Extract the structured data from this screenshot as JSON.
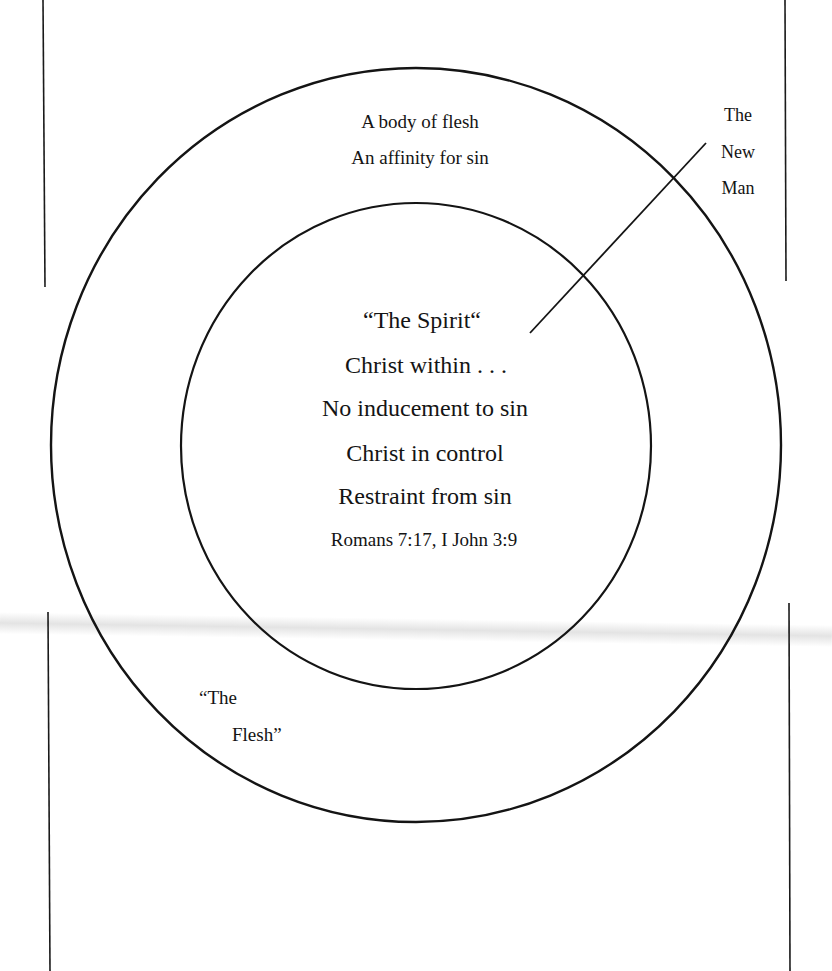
{
  "diagram": {
    "outer_circle": {
      "label": [
        "“The",
        "Flesh”"
      ],
      "description_lines": [
        "A body of flesh",
        "An affinity for sin"
      ]
    },
    "inner_circle": {
      "title": "“The Spirit“",
      "lines": [
        "Christ within . . .",
        "No inducement to sin",
        "Christ in control",
        "Restraint from sin"
      ],
      "reference": "Romans 7:17, I John 3:9"
    },
    "pointer_label": [
      "The",
      "New",
      "Man"
    ],
    "colors": {
      "ink": "#141414",
      "background": "#ffffff",
      "smudge": "#cdcdcd"
    }
  }
}
